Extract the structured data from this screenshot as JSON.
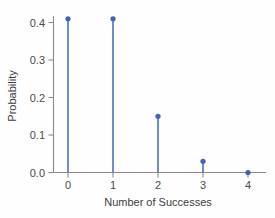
{
  "chart_data": {
    "type": "scatter",
    "plot_style": "stem",
    "title": "",
    "subtitle": "",
    "xlabel": "Number of Successes",
    "ylabel": "Probability",
    "categories": [
      "0",
      "1",
      "2",
      "3",
      "4"
    ],
    "x": [
      0,
      1,
      2,
      3,
      4
    ],
    "values": [
      0.41,
      0.41,
      0.15,
      0.03,
      0.0
    ],
    "series": [
      {
        "name": "Probability",
        "values": [
          0.41,
          0.41,
          0.15,
          0.03,
          0.0
        ],
        "color": "#4a6fc0"
      }
    ],
    "xlim": [
      -0.25,
      4.3
    ],
    "ylim": [
      0.0,
      0.44
    ],
    "xticks": [
      0,
      1,
      2,
      3,
      4
    ],
    "xtick_labels": [
      "0",
      "1",
      "2",
      "3",
      "4"
    ],
    "yticks": [
      0.0,
      0.1,
      0.2,
      0.3,
      0.4
    ],
    "ytick_labels": [
      "0.0",
      "0.1",
      "0.2",
      "0.3",
      "0.4"
    ],
    "grid": false,
    "legend": false,
    "legend_position": "none",
    "annotations": []
  },
  "figure": {
    "background_color": "#fefeff",
    "axis_color": "#8a8a8a",
    "marker_color": "#3f63b5",
    "stem_color": "#4a6fc0",
    "text_color": "#3d3d3d"
  }
}
